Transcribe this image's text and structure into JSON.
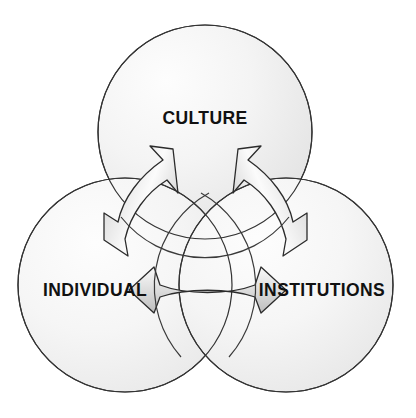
{
  "diagram": {
    "type": "venn-three-circle-with-arrows",
    "background_color": "#ffffff",
    "circle_fill_light": "#fbfbfb",
    "circle_fill_dark": "#e6e6e6",
    "circle_stroke": "#333333",
    "arrow_fill_light": "#fdfdfd",
    "arrow_fill_dark": "#c9c9c9",
    "arrow_stroke": "#2b2b2b",
    "label_color": "#111111",
    "circles": [
      {
        "id": "culture",
        "label": "CULTURE",
        "cx": 205,
        "cy": 132,
        "r": 107,
        "label_x": 205,
        "label_y": 119
      },
      {
        "id": "individual",
        "label": "INDIVIDUAL",
        "cx": 125,
        "cy": 285,
        "r": 107,
        "label_x": 95,
        "label_y": 291
      },
      {
        "id": "institutions",
        "label": "INSTITUTIONS",
        "cx": 286,
        "cy": 285,
        "r": 107,
        "label_x": 322,
        "label_y": 291
      }
    ],
    "arrows": [
      {
        "id": "culture-individual",
        "from": "CULTURE",
        "to": "INDIVIDUAL",
        "double_headed": true
      },
      {
        "id": "culture-institutions",
        "from": "CULTURE",
        "to": "INSTITUTIONS",
        "double_headed": true
      },
      {
        "id": "individual-institutions",
        "from": "INDIVIDUAL",
        "to": "INSTITUTIONS",
        "double_headed": true
      }
    ]
  }
}
